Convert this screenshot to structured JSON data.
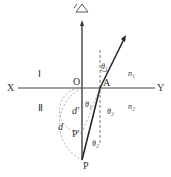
{
  "labels": {
    "X": "X",
    "Y": "Y",
    "O": "O",
    "A": "A",
    "P": "P",
    "P_prime": "P'",
    "region1": "Ⅰ",
    "region2": "Ⅱ",
    "n1": "n₁",
    "n2": "n₂",
    "theta1_top": "θ₁",
    "theta1_bottom": "θ₁",
    "theta2_right": "θ₂",
    "theta2_bottom": "θ₂",
    "d": "d",
    "d_prime": "d'"
  },
  "icons": {
    "eye": "eye-icon"
  }
}
